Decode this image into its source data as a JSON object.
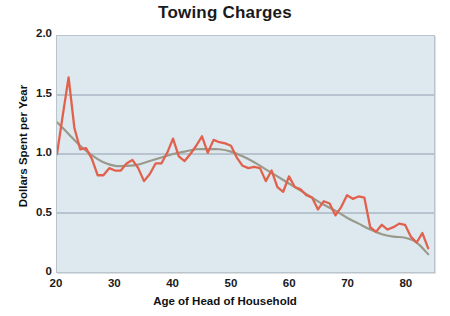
{
  "chart_data": {
    "type": "line",
    "title": "Towing Charges",
    "xlabel": "Age of Head of Household",
    "ylabel": "Dollars Spent per Year",
    "xlim": [
      20,
      85
    ],
    "ylim": [
      0,
      2.0
    ],
    "xticks": [
      "20",
      "30",
      "40",
      "50",
      "60",
      "70",
      "80"
    ],
    "xtick_values": [
      20,
      30,
      40,
      50,
      60,
      70,
      80
    ],
    "yticks": [
      "0",
      "0.5",
      "1.0",
      "1.5",
      "2.0"
    ],
    "ytick_values": [
      0,
      0.5,
      1.0,
      1.5,
      2.0
    ],
    "grid": "horizontal",
    "legend": "none",
    "colors": {
      "data_line": "#e1614d",
      "trend_line": "#9a9a8c",
      "plot_background": "#dde8ef",
      "gridline": "#8f9fae",
      "plot_border": "#b9c4cc",
      "text": "#1a1a1a"
    },
    "series": [
      {
        "name": "Dollars Spent per Year",
        "type": "line",
        "color": "#e1614d",
        "x": [
          20,
          21,
          22,
          23,
          24,
          25,
          26,
          27,
          28,
          29,
          30,
          31,
          32,
          33,
          34,
          35,
          36,
          37,
          38,
          39,
          40,
          41,
          42,
          43,
          44,
          45,
          46,
          47,
          48,
          49,
          50,
          51,
          52,
          53,
          54,
          55,
          56,
          57,
          58,
          59,
          60,
          61,
          62,
          63,
          64,
          65,
          66,
          67,
          68,
          69,
          70,
          71,
          72,
          73,
          74,
          75,
          76,
          77,
          78,
          79,
          80,
          81,
          82,
          83,
          84
        ],
        "values": [
          1.0,
          1.33,
          1.65,
          1.22,
          1.04,
          1.05,
          0.96,
          0.82,
          0.82,
          0.88,
          0.86,
          0.86,
          0.92,
          0.95,
          0.88,
          0.77,
          0.83,
          0.92,
          0.92,
          1.01,
          1.13,
          0.98,
          0.94,
          1.0,
          1.07,
          1.15,
          1.01,
          1.12,
          1.1,
          1.09,
          1.07,
          0.97,
          0.9,
          0.88,
          0.89,
          0.88,
          0.77,
          0.86,
          0.72,
          0.68,
          0.81,
          0.72,
          0.7,
          0.65,
          0.63,
          0.53,
          0.6,
          0.58,
          0.48,
          0.55,
          0.65,
          0.62,
          0.64,
          0.63,
          0.38,
          0.34,
          0.4,
          0.36,
          0.38,
          0.41,
          0.4,
          0.3,
          0.25,
          0.33,
          0.2
        ]
      },
      {
        "name": "Smoothed trend",
        "type": "line",
        "color": "#9a9a8c",
        "x": [
          20,
          22,
          24,
          26,
          28,
          30,
          32,
          34,
          36,
          38,
          40,
          42,
          44,
          46,
          48,
          50,
          52,
          54,
          56,
          58,
          60,
          62,
          64,
          66,
          68,
          70,
          72,
          74,
          76,
          78,
          80,
          82,
          84
        ],
        "values": [
          1.27,
          1.17,
          1.07,
          0.99,
          0.93,
          0.9,
          0.9,
          0.91,
          0.94,
          0.97,
          1.0,
          1.02,
          1.04,
          1.04,
          1.04,
          1.02,
          0.98,
          0.93,
          0.87,
          0.81,
          0.75,
          0.69,
          0.63,
          0.57,
          0.52,
          0.46,
          0.41,
          0.36,
          0.32,
          0.3,
          0.29,
          0.25,
          0.15
        ]
      }
    ]
  }
}
